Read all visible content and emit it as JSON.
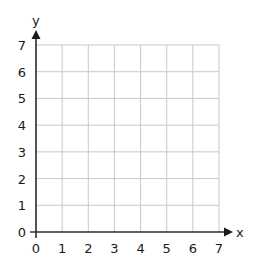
{
  "chart_data": {
    "type": "scatter",
    "title": "",
    "xlabel": "x",
    "ylabel": "y",
    "x_ticks": [
      "0",
      "1",
      "2",
      "3",
      "4",
      "5",
      "6",
      "7"
    ],
    "y_ticks": [
      "0",
      "1",
      "2",
      "3",
      "4",
      "5",
      "6",
      "7"
    ],
    "xlim": [
      0,
      7
    ],
    "ylim": [
      0,
      7
    ],
    "grid": true,
    "series": [],
    "legend": null
  },
  "colors": {
    "axis": "#2a2a2a",
    "grid": "#c8c8c8",
    "text": "#1a1a1a",
    "background": "#ffffff"
  }
}
